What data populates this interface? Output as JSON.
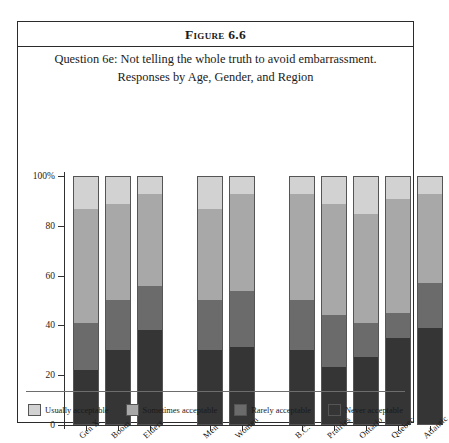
{
  "figure": {
    "number_label": "Figure 6.6",
    "caption_line_1": "Question 6e: Not telling the whole truth to avoid embarrassment.",
    "caption_line_2": "Responses by Age, Gender, and Region"
  },
  "chart_data": {
    "type": "bar",
    "subtype": "stacked-100-percent-vertical",
    "title": "Question 6e: Not telling the whole truth to avoid embarrassment. Responses by Age, Gender, and Region",
    "xlabel": "",
    "ylabel": "",
    "ylim": [
      0,
      100
    ],
    "ytick_labels": [
      "0",
      "20",
      "40",
      "60",
      "80",
      "100%"
    ],
    "ytick_values": [
      0,
      20,
      40,
      60,
      80,
      100
    ],
    "grid": false,
    "legend_position": "bottom",
    "categories": [
      "Gen X",
      "Boom",
      "Elders",
      "Men",
      "Women",
      "B.C.",
      "Prairies",
      "Ontario",
      "Quebec",
      "Atlantic"
    ],
    "group_breaks_after": [
      "Elders",
      "Women"
    ],
    "series": [
      {
        "name": "Usually acceptable",
        "color": "#d2d2d2",
        "values": [
          13,
          11,
          7,
          13,
          7,
          7,
          11,
          15,
          9,
          7
        ]
      },
      {
        "name": "Sometimes acceptable",
        "color": "#a8a8a8",
        "values": [
          46,
          39,
          37,
          37,
          39,
          43,
          45,
          44,
          46,
          36
        ]
      },
      {
        "name": "Rarely acceptable",
        "color": "#6b6b6b",
        "values": [
          19,
          20,
          18,
          20,
          23,
          20,
          21,
          14,
          10,
          18
        ]
      },
      {
        "name": "Never acceptable",
        "color": "#353535",
        "values": [
          22,
          30,
          38,
          30,
          31,
          30,
          23,
          27,
          35,
          39
        ]
      }
    ]
  }
}
